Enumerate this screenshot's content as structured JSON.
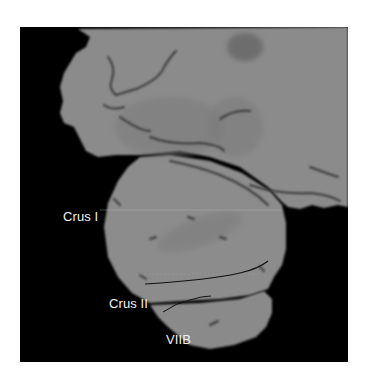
{
  "figure": {
    "colors": {
      "background": "#ffffff",
      "frame": "#000000",
      "tissue": "#8b8b8b",
      "tissue_dark": "#6e6e6e",
      "sulcus": "#3a3a3a",
      "boundary_line": "#111111",
      "label_text": "#f2f2f2"
    },
    "labels": {
      "crus_i": "Crus I",
      "crus_ii": "Crus II",
      "viib": "VIIB"
    }
  }
}
